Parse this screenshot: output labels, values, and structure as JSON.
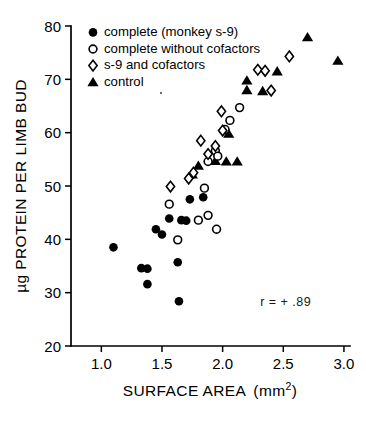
{
  "chart_data": {
    "type": "scatter",
    "title": "",
    "xlabel": "SURFACE AREA (mm2)",
    "xlabel_main": "SURFACE AREA",
    "xlabel_unit_base": "(mm",
    "xlabel_unit_sup": "2",
    "xlabel_unit_close": ")",
    "ylabel": "µg PROTEIN PER LIMB BUD",
    "xlim": [
      0.75,
      3.05
    ],
    "ylim": [
      20,
      80
    ],
    "xticks": [
      1.0,
      1.5,
      2.0,
      2.5,
      3.0
    ],
    "xtick_labels": [
      "1.0",
      "1.5",
      "2.0",
      "2.5",
      "3.0"
    ],
    "yticks": [
      20,
      30,
      40,
      50,
      60,
      70,
      80
    ],
    "ytick_labels": [
      "20",
      "30",
      "40",
      "50",
      "60",
      "70",
      "80"
    ],
    "grid": false,
    "legend_position": "top-left",
    "annotations": [
      {
        "text": "r = + .89",
        "x": 2.52,
        "y": 27.5
      }
    ],
    "series": [
      {
        "name": "complete (monkey s-9)",
        "marker": "filled-circle",
        "color": "#000000",
        "points": [
          [
            1.1,
            38.5
          ],
          [
            1.33,
            34.6
          ],
          [
            1.38,
            34.5
          ],
          [
            1.38,
            31.6
          ],
          [
            1.45,
            41.9
          ],
          [
            1.5,
            40.9
          ],
          [
            1.56,
            43.9
          ],
          [
            1.63,
            35.7
          ],
          [
            1.64,
            28.4
          ],
          [
            1.66,
            43.6
          ],
          [
            1.7,
            43.5
          ],
          [
            1.73,
            47.5
          ],
          [
            1.84,
            47.9
          ]
        ]
      },
      {
        "name": "complete without cofactors",
        "marker": "open-circle",
        "color": "#000000",
        "points": [
          [
            1.56,
            46.6
          ],
          [
            1.63,
            39.9
          ],
          [
            1.8,
            43.6
          ],
          [
            1.88,
            44.5
          ],
          [
            1.95,
            41.9
          ],
          [
            1.85,
            49.6
          ],
          [
            1.88,
            54.6
          ],
          [
            1.94,
            56.6
          ],
          [
            1.96,
            55.6
          ],
          [
            2.02,
            60.6
          ],
          [
            2.06,
            62.3
          ],
          [
            2.14,
            64.7
          ]
        ]
      },
      {
        "name": "s-9 and cofactors",
        "marker": "open-diamond",
        "color": "#000000",
        "points": [
          [
            1.57,
            49.9
          ],
          [
            1.72,
            51.4
          ],
          [
            1.76,
            52.5
          ],
          [
            1.82,
            58.5
          ],
          [
            1.88,
            56.0
          ],
          [
            1.94,
            57.5
          ],
          [
            1.99,
            64.0
          ],
          [
            2.0,
            60.4
          ],
          [
            2.29,
            71.8
          ],
          [
            2.35,
            71.6
          ],
          [
            2.4,
            67.9
          ],
          [
            2.55,
            74.3
          ]
        ]
      },
      {
        "name": "control",
        "marker": "filled-triangle",
        "color": "#000000",
        "points": [
          [
            1.75,
            52.2
          ],
          [
            1.8,
            53.8
          ],
          [
            1.94,
            54.7
          ],
          [
            2.03,
            54.6
          ],
          [
            2.12,
            54.6
          ],
          [
            2.05,
            59.8
          ],
          [
            2.2,
            69.8
          ],
          [
            2.2,
            68.0
          ],
          [
            2.33,
            67.8
          ],
          [
            2.45,
            71.5
          ],
          [
            2.7,
            77.9
          ],
          [
            2.95,
            73.5
          ]
        ]
      }
    ]
  },
  "legend": {
    "items": [
      {
        "marker": "filled-circle",
        "label": "complete (monkey s-9)"
      },
      {
        "marker": "open-circle",
        "label": "complete without cofactors"
      },
      {
        "marker": "open-diamond",
        "label": "s-9 and cofactors"
      },
      {
        "marker": "filled-triangle",
        "label": "control"
      }
    ]
  }
}
